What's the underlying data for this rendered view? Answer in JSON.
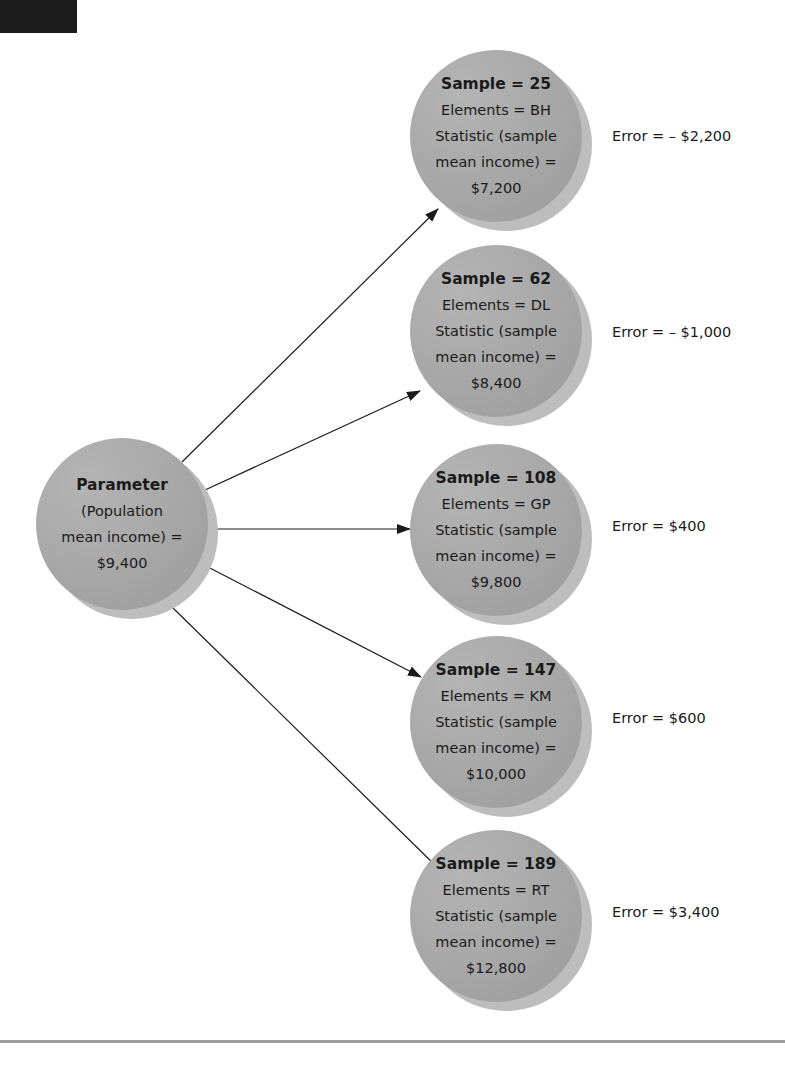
{
  "figure": {
    "parameter": {
      "title": "Parameter",
      "line1": "(Population",
      "line2": "mean income) =",
      "value": "$9,400"
    },
    "samples": [
      {
        "title": "Sample = 25",
        "elements": "Elements = BH",
        "line1": "Statistic (sample",
        "line2": "mean income) =",
        "value": "$7,200",
        "error": "Error = – $2,200"
      },
      {
        "title": "Sample = 62",
        "elements": "Elements = DL",
        "line1": "Statistic (sample",
        "line2": "mean income) =",
        "value": "$8,400",
        "error": "Error = – $1,000"
      },
      {
        "title": "Sample = 108",
        "elements": "Elements = GP",
        "line1": "Statistic (sample",
        "line2": "mean income) =",
        "value": "$9,800",
        "error": "Error = $400"
      },
      {
        "title": "Sample = 147",
        "elements": "Elements = KM",
        "line1": "Statistic (sample",
        "line2": "mean income) =",
        "value": "$10,000",
        "error": "Error = $600"
      },
      {
        "title": "Sample = 189",
        "elements": "Elements = RT",
        "line1": "Statistic (sample",
        "line2": "mean income) =",
        "value": "$12,800",
        "error": "Error = $3,400"
      }
    ],
    "colors": {
      "node_fill": "#a9a9a9",
      "node_shadow": "#bdbdbd",
      "arrow": "#1a1a1a",
      "rule": "#9e9e9e"
    }
  }
}
